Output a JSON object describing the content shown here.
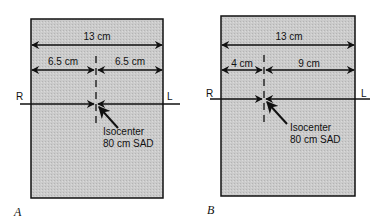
{
  "colors": {
    "field_fill": "#c9c9c9",
    "line": "#111111",
    "background": "#ffffff"
  },
  "panels": [
    {
      "label": "A",
      "total_width": "13 cm",
      "left_width": "6.5 cm",
      "right_width": "6.5 cm",
      "left_side": "R",
      "right_side": "L",
      "isocenter_line1": "Isocenter",
      "isocenter_line2": "80 cm SAD"
    },
    {
      "label": "B",
      "total_width": "13 cm",
      "left_width": "4 cm",
      "right_width": "9 cm",
      "left_side": "R",
      "right_side": "L",
      "isocenter_line1": "Isocenter",
      "isocenter_line2": "80 cm SAD"
    }
  ]
}
